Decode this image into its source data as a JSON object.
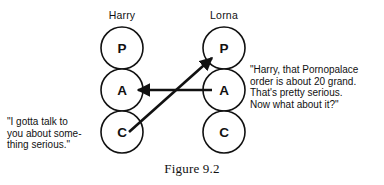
{
  "figure": {
    "caption": "Figure 9.2",
    "type": "transactional-analysis-diagram"
  },
  "people": [
    {
      "id": "harry",
      "name": "Harry",
      "side": "left",
      "ego_states": [
        {
          "code": "P",
          "name": "Parent"
        },
        {
          "code": "A",
          "name": "Adult"
        },
        {
          "code": "C",
          "name": "Child"
        }
      ],
      "speech": {
        "lines": [
          "\"I gotta talk to",
          "you about some-",
          "thing serious.\""
        ],
        "text": "\"I gotta talk to you about something serious.\""
      }
    },
    {
      "id": "lorna",
      "name": "Lorna",
      "side": "right",
      "ego_states": [
        {
          "code": "P",
          "name": "Parent"
        },
        {
          "code": "A",
          "name": "Adult"
        },
        {
          "code": "C",
          "name": "Child"
        }
      ],
      "speech": {
        "lines": [
          "\"Harry, that Pornopalace",
          "order is about 20 grand.",
          "That's pretty serious.",
          "Now what about it?\""
        ],
        "text": "\"Harry, that Pornopalace order is about 20 grand. That's pretty serious. Now what about it?\""
      }
    }
  ],
  "transactions": [
    {
      "id": "lorna-adult-to-harry-adult",
      "from": "lorna.A",
      "to": "harry.A",
      "direction": "right-to-left",
      "style": "horizontal-arrow"
    },
    {
      "id": "harry-child-to-lorna-parent",
      "from": "harry.C",
      "to": "lorna.P",
      "direction": "lower-left-to-upper-right",
      "style": "diagonal-arrow"
    }
  ],
  "colors": {
    "ink": "#111111",
    "background": "#ffffff"
  }
}
